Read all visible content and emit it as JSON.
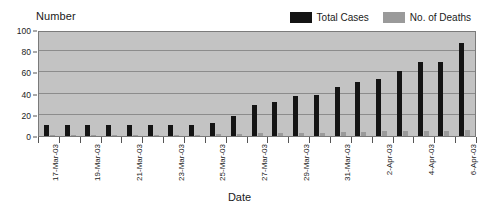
{
  "chart_data": {
    "type": "bar",
    "title": "",
    "xlabel": "Date",
    "ylabel": "Number",
    "ylim": [
      0,
      100
    ],
    "yticks": [
      0,
      20,
      40,
      60,
      80,
      100
    ],
    "grid": true,
    "legend_position": "top-right",
    "categories": [
      "17-Mar-03",
      "18-Mar-03",
      "19-Mar-03",
      "20-Mar-03",
      "21-Mar-03",
      "22-Mar-03",
      "23-Mar-03",
      "24-Mar-03",
      "25-Mar-03",
      "26-Mar-03",
      "27-Mar-03",
      "28-Mar-03",
      "29-Mar-03",
      "30-Mar-03",
      "31-Mar-03",
      "1-Apr-03",
      "2-Apr-03",
      "3-Apr-03",
      "4-Apr-03",
      "5-Apr-03",
      "6-Apr-03"
    ],
    "tick_labels_shown": [
      "17-Mar-03",
      "",
      "19-Mar-03",
      "",
      "21-Mar-03",
      "",
      "23-Mar-03",
      "",
      "25-Mar-03",
      "",
      "27-Mar-03",
      "",
      "29-Mar-03",
      "",
      "31-Mar-03",
      "",
      "2-Apr-03",
      "",
      "4-Apr-03",
      "",
      "6-Apr-03"
    ],
    "series": [
      {
        "name": "Total Cases",
        "color": "#141414",
        "values": [
          10,
          10,
          10,
          10,
          10,
          10,
          10,
          10,
          12,
          19,
          29,
          32,
          38,
          39,
          46,
          51,
          54,
          61,
          70,
          70,
          88
        ]
      },
      {
        "name": "No. of Deaths",
        "color": "#9a9a9a",
        "values": [
          1,
          1,
          1,
          1,
          1,
          1,
          1,
          1,
          2,
          2,
          3,
          3,
          3,
          3,
          4,
          4,
          5,
          5,
          5,
          5,
          6
        ]
      }
    ]
  },
  "axis": {
    "y_title": "Number",
    "x_title": "Date"
  },
  "colors": {
    "plot_background": "#c3c3c3",
    "gridline": "#8c8c8c",
    "plot_border": "#7a7a7a",
    "total_cases": "#141414",
    "deaths": "#9a9a9a"
  }
}
